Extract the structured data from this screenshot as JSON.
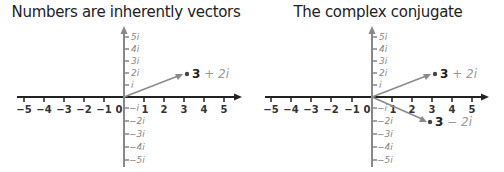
{
  "panels": [
    {
      "title": "Numbers are inherently vectors",
      "x_ticks": [
        "−5",
        "−4",
        "−3",
        "−2",
        "−1",
        "0",
        "1",
        "2",
        "3",
        "4",
        "5"
      ],
      "y_ticks_pos": [
        "5i",
        "4i",
        "3i",
        "2i",
        "i"
      ],
      "y_ticks_neg": [
        "−i",
        "−2i",
        "−3i",
        "−4i",
        "−5i"
      ],
      "points": [
        {
          "re": "3",
          "op": " + ",
          "im": "2i",
          "x": 3,
          "y": 2
        }
      ]
    },
    {
      "title": "The complex conjugate",
      "x_ticks": [
        "−5",
        "−4",
        "−3",
        "−2",
        "−1",
        "0",
        "1",
        "2",
        "3",
        "4",
        "5"
      ],
      "y_ticks_pos": [
        "5i",
        "4i",
        "3i",
        "2i",
        "i"
      ],
      "y_ticks_neg": [
        "−i",
        "−2i",
        "−3i",
        "−4i",
        "−5i"
      ],
      "points": [
        {
          "re": "3",
          "op": " + ",
          "im": "2i",
          "x": 3,
          "y": 2
        },
        {
          "re": "3",
          "op": " − ",
          "im": "2i",
          "x": 3,
          "y": -2
        }
      ]
    }
  ],
  "colors": {
    "axis_h": "#222222",
    "axis_v": "#888888",
    "vector": "#8a8a8a",
    "label_dark": "#222222",
    "label_light": "#999999"
  }
}
